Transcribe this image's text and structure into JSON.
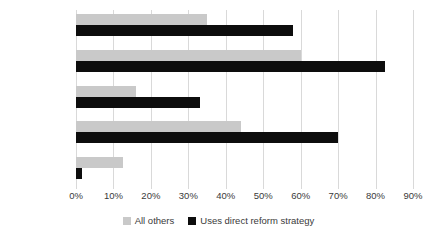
{
  "chart_data": {
    "type": "bar",
    "orientation": "horizontal",
    "title": "",
    "subtitle": "",
    "xlabel": "",
    "ylabel": "",
    "categories": [
      "executive",
      "legislative",
      "judicial",
      "bureaucratic",
      "none"
    ],
    "series": [
      {
        "name": "All others",
        "color": "#c9c9c9",
        "values": [
          35,
          60,
          16,
          44,
          12.5
        ]
      },
      {
        "name": "Uses direct reform strategy",
        "color": "#0d0d0d",
        "values": [
          58,
          82.5,
          33,
          70,
          1.5
        ]
      }
    ],
    "xlim": [
      0,
      90
    ],
    "xtick_values": [
      0,
      10,
      20,
      30,
      40,
      50,
      60,
      70,
      80,
      90
    ],
    "xtick_labels": [
      "0%",
      "10%",
      "20%",
      "30%",
      "40%",
      "50%",
      "60%",
      "70%",
      "80%",
      "90%"
    ],
    "grid": "vertical",
    "legend_position": "bottom-center",
    "value_unit": "%"
  }
}
